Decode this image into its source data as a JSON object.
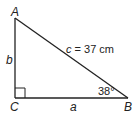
{
  "diagram": {
    "type": "right-triangle",
    "vertices": {
      "A": {
        "label": "A"
      },
      "B": {
        "label": "B"
      },
      "C": {
        "label": "C"
      }
    },
    "sides": {
      "a": {
        "label": "a"
      },
      "b": {
        "label": "b"
      },
      "c": {
        "label": "c = 37 cm",
        "variable": "c",
        "equals": "=",
        "value": "37 cm"
      }
    },
    "angle_B": {
      "label": "38°"
    },
    "right_angle_at": "C",
    "colors": {
      "stroke": "#222222",
      "background": "#ffffff"
    }
  }
}
